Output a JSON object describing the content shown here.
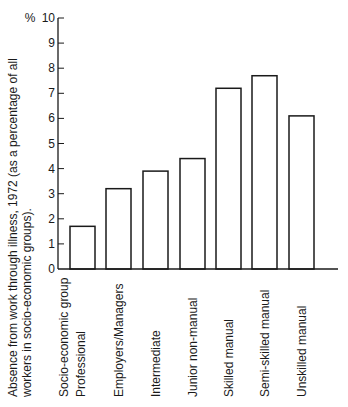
{
  "chart_data": {
    "type": "bar",
    "title": "",
    "xlabel": "Socio-economic group",
    "ylabel_lines": [
      "Absence from work through illness, 1972 (as a percentage of all",
      "workers in socio-economic groups)."
    ],
    "y_unit": "%",
    "categories": [
      "Professional",
      "Employers/Managers",
      "Intermediate",
      "Junior non-manual",
      "Skilled manual",
      "Semi-skilled manual",
      "Unskilled manual"
    ],
    "values": [
      1.7,
      3.2,
      3.9,
      4.4,
      7.2,
      7.7,
      6.1
    ],
    "ylim": [
      0,
      10
    ],
    "yticks": [
      0,
      1,
      2,
      3,
      4,
      5,
      6,
      7,
      8,
      9,
      10
    ],
    "grid": false,
    "legend": null,
    "colors": {
      "bar_fill": "#ffffff",
      "bar_stroke": "#1a1a1a",
      "axis": "#1a1a1a"
    }
  }
}
